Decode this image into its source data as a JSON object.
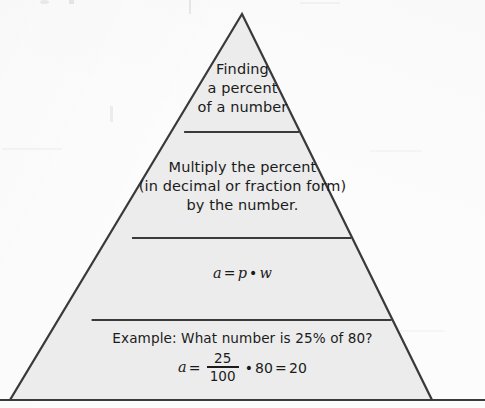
{
  "document": {
    "type": "pyramid-concept-diagram",
    "subject": "Finding a percent of a number",
    "background_color": "#fcfcfc",
    "fill_color": "#ececec",
    "stroke_color": "#3a3a3a",
    "text_color": "#1b1b1b"
  },
  "pyramid": {
    "apex": {
      "x": 242,
      "y": 14
    },
    "base_left": {
      "x": 10,
      "y": 400
    },
    "base_right": {
      "x": 432,
      "y": 400
    },
    "baseline_extends_full_width": true,
    "dividers_y": [
      132,
      238,
      320
    ],
    "tiers": [
      {
        "id": "tier-1",
        "name": "concept",
        "lines": [
          "Finding",
          "a percent",
          "of a number"
        ]
      },
      {
        "id": "tier-2",
        "name": "procedure",
        "lines": [
          "Multiply the percent",
          "(in decimal or fraction form)",
          "by the number."
        ]
      },
      {
        "id": "tier-3",
        "name": "formula",
        "equation": {
          "lhs": "a",
          "equals": "=",
          "factor_1": "p",
          "operator": "•",
          "factor_2": "w"
        }
      },
      {
        "id": "tier-4",
        "name": "example",
        "prompt": "Example:  What number is 25% of 80?",
        "equation": {
          "lhs": "a",
          "equals": "=",
          "numerator": "25",
          "denominator": "100",
          "operator": "•",
          "factor": "80",
          "equals_2": "=",
          "result": "20"
        }
      }
    ]
  }
}
